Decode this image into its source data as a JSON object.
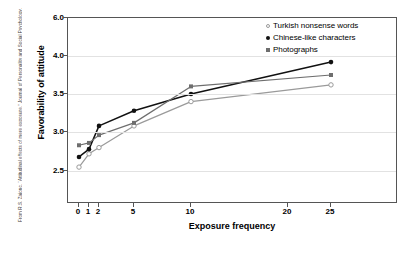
{
  "credit": {
    "text": "From R.S. Zajonc, “Attitudinal effects of mere exposure,” Journal of Personality and Social Psychology, Monograph Supplement 9, 1968, 1–27 Copyright © 1968 by the American Psychological Association. Reprinted by permission."
  },
  "chart_data": {
    "type": "line",
    "title": "",
    "xlabel": "Exposure frequency",
    "ylabel": "Favorability of attitude",
    "x": [
      0,
      1,
      2,
      5,
      10,
      25
    ],
    "xtick_labels": [
      "0",
      "1",
      "2",
      "5",
      "10",
      "20",
      "25"
    ],
    "xtick_values": [
      0,
      1,
      2,
      5,
      10,
      20,
      25
    ],
    "ytick_labels": [
      "6.0",
      "4.0",
      "3.5",
      "3.0",
      "2.5"
    ],
    "ytick_values": [
      6.0,
      4.0,
      3.5,
      3.0,
      2.5
    ],
    "ylim": [
      2.5,
      6.0
    ],
    "grid": true,
    "legend_position": "top-right",
    "axis_note": "Both axes use compressed non-linear spacing",
    "series": [
      {
        "name": "Turkish nonsense words",
        "marker": "open-circle",
        "color": "#9a9a9a",
        "values": [
          2.55,
          2.72,
          2.8,
          3.08,
          3.4,
          3.62
        ]
      },
      {
        "name": "Chinese-like characters",
        "marker": "filled-circle",
        "color": "#111111",
        "values": [
          2.68,
          2.78,
          3.08,
          3.28,
          3.5,
          3.92
        ]
      },
      {
        "name": "Photographs",
        "marker": "filled-square",
        "color": "#6e6e6e",
        "values": [
          2.83,
          2.86,
          2.96,
          3.12,
          3.6,
          3.75
        ]
      }
    ]
  },
  "legend": {
    "items": [
      {
        "label": "Turkish nonsense words",
        "marker": "open-circle"
      },
      {
        "label": "Chinese-like characters",
        "marker": "filled-circle"
      },
      {
        "label": "Photographs",
        "marker": "filled-square"
      }
    ]
  }
}
